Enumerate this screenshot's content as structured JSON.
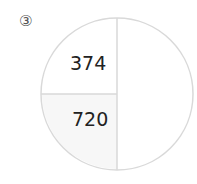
{
  "problem": {
    "number": "③"
  },
  "diagram": {
    "type": "part-whole circle",
    "parts": [
      "374",
      "720"
    ],
    "whole": ""
  }
}
